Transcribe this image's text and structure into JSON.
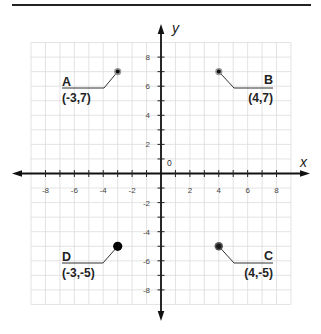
{
  "figure": {
    "axes": {
      "x_label": "x",
      "y_label": "y",
      "origin_label": "0"
    },
    "x_ticks": [
      "-8",
      "-6",
      "-4",
      "-2",
      "2",
      "4",
      "6",
      "8"
    ],
    "y_ticks": [
      "8",
      "6",
      "4",
      "2",
      "-2",
      "-4",
      "-6",
      "-8"
    ],
    "points": [
      {
        "name": "A",
        "coords": "(-3,7)"
      },
      {
        "name": "B",
        "coords": "(4,7)"
      },
      {
        "name": "C",
        "coords": "(4,-5)"
      },
      {
        "name": "D",
        "coords": "(-3,-5)"
      }
    ]
  },
  "chart_data": {
    "type": "scatter",
    "title": "",
    "xlabel": "x",
    "ylabel": "y",
    "xlim": [
      -9,
      9
    ],
    "ylim": [
      -9,
      9
    ],
    "grid": true,
    "x_tick_labels": [
      -8,
      -6,
      -4,
      -2,
      2,
      4,
      6,
      8
    ],
    "y_tick_labels": [
      8,
      6,
      4,
      2,
      -2,
      -4,
      -6,
      -8
    ],
    "origin_label": "0",
    "points": [
      {
        "label": "A",
        "x": -3,
        "y": 7,
        "annotation": "(-3,7)"
      },
      {
        "label": "B",
        "x": 4,
        "y": 7,
        "annotation": "(4,7)"
      },
      {
        "label": "C",
        "x": 4,
        "y": -5,
        "annotation": "(4,-5)"
      },
      {
        "label": "D",
        "x": -3,
        "y": -5,
        "annotation": "(-3,-5)"
      }
    ]
  }
}
